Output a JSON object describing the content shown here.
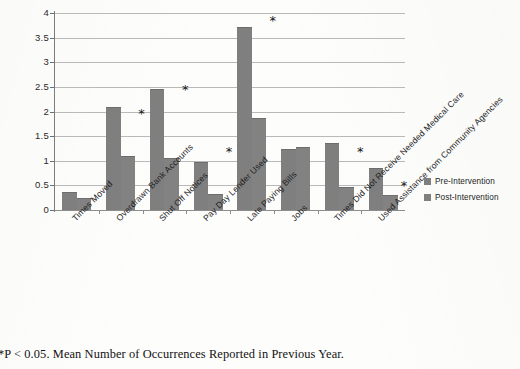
{
  "chart_data": {
    "type": "bar",
    "title": "",
    "xlabel": "",
    "ylabel": "",
    "ylim": [
      0,
      4
    ],
    "ytick_labels": [
      "0",
      "0.5",
      "1",
      "1.5",
      "2",
      "2.5",
      "3",
      "3.5",
      "4"
    ],
    "ytick_values": [
      0,
      0.5,
      1,
      1.5,
      2,
      2.5,
      3,
      3.5,
      4
    ],
    "grid": true,
    "legend_position": "right",
    "categories": [
      "Times Moved",
      "Overdrawn Bank Accounts",
      "Shut Off Notices",
      "Pay Day Lender Used",
      "Late Paying Bills",
      "Jobs",
      "Times Did Not Receive Needed Medical Care",
      "Used Assistance from Community Agencies"
    ],
    "series": [
      {
        "name": "Pre-Intervention",
        "color": "#7f7f7f",
        "values": [
          0.37,
          2.1,
          2.45,
          0.97,
          3.72,
          1.23,
          1.37,
          0.85
        ]
      },
      {
        "name": "Post-Intervention",
        "color": "#828282",
        "values": [
          0.25,
          1.1,
          1.05,
          0.33,
          1.87,
          1.28,
          0.47,
          0.3
        ]
      }
    ],
    "significance_markers": [
      {
        "category": "Overdrawn Bank Accounts",
        "symbol": "*",
        "value": 2.0
      },
      {
        "category": "Shut Off Notices",
        "symbol": "*",
        "value": 2.48
      },
      {
        "category": "Pay Day Lender Used",
        "symbol": "*",
        "value": 1.22
      },
      {
        "category": "Late Paying Bills",
        "symbol": "*",
        "value": 3.88
      },
      {
        "category": "Times Did Not Receive Needed Medical Care",
        "symbol": "*",
        "value": 1.22
      },
      {
        "category": "Used Assistance from Community Agencies",
        "symbol": "*",
        "value": 0.52
      }
    ],
    "annotations": []
  },
  "legend": {
    "items": [
      {
        "label": "Pre-Intervention"
      },
      {
        "label": "Post-Intervention"
      }
    ]
  },
  "caption": {
    "text": "*P < 0.05. Mean Number of Occurrences Reported in Previous Year."
  }
}
